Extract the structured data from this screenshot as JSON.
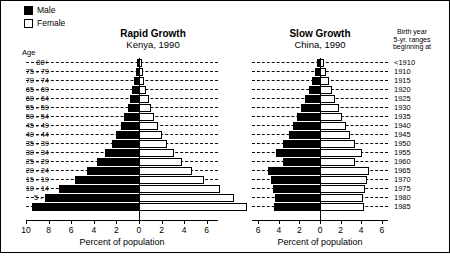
{
  "legend": {
    "items": [
      {
        "name": "male",
        "label": "Male",
        "color": "#000000"
      },
      {
        "name": "female",
        "label": "Female",
        "color": "#ffffff"
      }
    ]
  },
  "age_axis_header": "Age",
  "birth_year_header": {
    "line1": "Birth year",
    "line2": "5-yr. ranges",
    "line3": "beginning at"
  },
  "age_groups": [
    "80+",
    "75 - 79",
    "70 - 74",
    "65 - 69",
    "60 - 64",
    "55 - 59",
    "50 - 54",
    "45 - 49",
    "40 - 44",
    "35 - 39",
    "30 - 34",
    "25 - 29",
    "20 - 24",
    "15 - 19",
    "10 - 14",
    "5 - 9",
    "0 - 4"
  ],
  "birth_years": [
    "<1910",
    "1910",
    "1915",
    "1920",
    "1925",
    "1930",
    "1935",
    "1940",
    "1945",
    "1950",
    "1955",
    "1960",
    "1965",
    "1970",
    "1975",
    "1980",
    "1985"
  ],
  "panels": [
    {
      "id": "kenya",
      "title": "Rapid Growth",
      "subtitle": "Kenya, 1990",
      "xlabel": "Percent of population"
    },
    {
      "id": "china",
      "title": "Slow Growth",
      "subtitle": "China, 1990",
      "xlabel": "Percent of population"
    }
  ],
  "chart_data": [
    {
      "type": "bar",
      "title": "Rapid Growth",
      "subtitle": "Kenya, 1990",
      "orientation": "population-pyramid",
      "xlabel": "Percent of population",
      "ylabel": "Age",
      "categories": [
        "80+",
        "75 - 79",
        "70 - 74",
        "65 - 69",
        "60 - 64",
        "55 - 59",
        "50 - 54",
        "45 - 49",
        "40 - 44",
        "35 - 39",
        "30 - 34",
        "25 - 29",
        "20 - 24",
        "15 - 19",
        "10 - 14",
        "5 - 9",
        "0 - 4"
      ],
      "birth_years": [
        "<1910",
        "1910",
        "1915",
        "1920",
        "1925",
        "1930",
        "1935",
        "1940",
        "1945",
        "1950",
        "1955",
        "1960",
        "1965",
        "1970",
        "1975",
        "1980",
        "1985"
      ],
      "series": [
        {
          "name": "Male",
          "side": "left",
          "values": [
            0.2,
            0.3,
            0.4,
            0.6,
            0.8,
            1.0,
            1.3,
            1.6,
            2.0,
            2.4,
            3.0,
            3.7,
            4.6,
            5.7,
            7.1,
            8.3,
            9.5
          ]
        },
        {
          "name": "Female",
          "side": "right",
          "values": [
            0.25,
            0.35,
            0.45,
            0.65,
            0.85,
            1.05,
            1.35,
            1.65,
            2.05,
            2.5,
            3.1,
            3.8,
            4.7,
            5.8,
            7.2,
            8.4,
            9.6
          ]
        }
      ],
      "xticks_left": [
        10,
        8,
        6,
        4,
        2,
        0
      ],
      "xticks_right": [
        0,
        2,
        4,
        6
      ],
      "xlim_left": 10,
      "xlim_right": 7,
      "grid": true,
      "legend_position": "top-left"
    },
    {
      "type": "bar",
      "title": "Slow Growth",
      "subtitle": "China, 1990",
      "orientation": "population-pyramid",
      "xlabel": "Percent of population",
      "ylabel": "Age",
      "categories": [
        "80+",
        "75 - 79",
        "70 - 74",
        "65 - 69",
        "60 - 64",
        "55 - 59",
        "50 - 54",
        "45 - 49",
        "40 - 44",
        "35 - 39",
        "30 - 34",
        "25 - 29",
        "20 - 24",
        "15 - 19",
        "10 - 14",
        "5 - 9",
        "0 - 4"
      ],
      "birth_years": [
        "<1910",
        "1910",
        "1915",
        "1920",
        "1925",
        "1930",
        "1935",
        "1940",
        "1945",
        "1950",
        "1955",
        "1960",
        "1965",
        "1970",
        "1975",
        "1980",
        "1985"
      ],
      "series": [
        {
          "name": "Male",
          "side": "left",
          "values": [
            0.3,
            0.5,
            0.8,
            1.1,
            1.5,
            1.8,
            2.2,
            2.6,
            3.0,
            3.6,
            4.3,
            3.6,
            5.0,
            4.8,
            4.6,
            4.4,
            4.5
          ]
        },
        {
          "name": "Female",
          "side": "right",
          "values": [
            0.4,
            0.6,
            0.9,
            1.2,
            1.5,
            1.8,
            2.1,
            2.5,
            2.9,
            3.4,
            4.1,
            3.4,
            4.8,
            4.6,
            4.4,
            4.2,
            4.3
          ]
        }
      ],
      "xticks_left": [
        6,
        4,
        2,
        0
      ],
      "xticks_right": [
        0,
        2,
        4,
        6
      ],
      "xlim_left": 6.6,
      "xlim_right": 6.6,
      "grid": true,
      "legend_position": "top-left"
    }
  ]
}
